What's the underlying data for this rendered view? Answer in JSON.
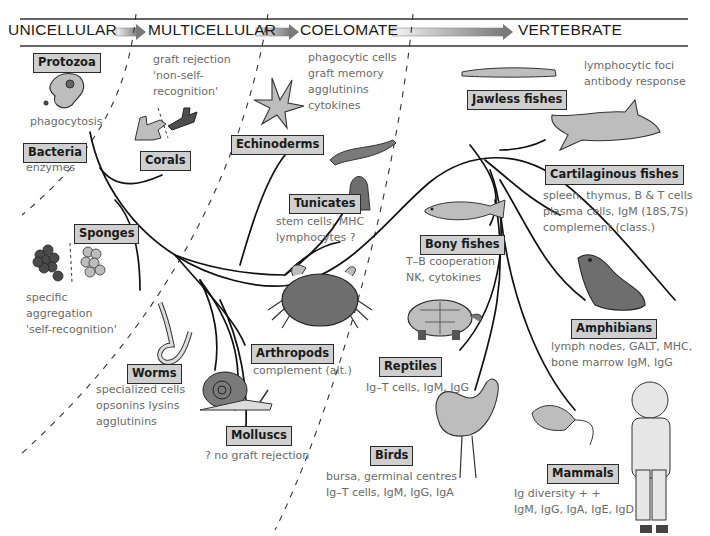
{
  "header": {
    "stages": [
      {
        "label": "UNICELLULAR",
        "x": 8
      },
      {
        "label": "MULTICELLULAR",
        "x": 148
      },
      {
        "label": "COELOMATE",
        "x": 300
      },
      {
        "label": "VERTEBRATE",
        "x": 518
      }
    ],
    "arrow_color_start": "#f2f2f2",
    "arrow_color_end": "#7a7a7a"
  },
  "colors": {
    "tag_fill": "#cfcfcf",
    "tag_border": "#2a2a2a",
    "note_text": "#6a6a6a",
    "animal_fill_light": "#bdbdbd",
    "animal_fill_dark": "#5e5e5e"
  },
  "groups": [
    {
      "id": "protozoa",
      "label": "Protozoa",
      "notes": [
        "phagocytosis"
      ]
    },
    {
      "id": "bacteria",
      "label": "Bacteria",
      "notes": [
        "enzymes"
      ]
    },
    {
      "id": "corals",
      "label": "Corals",
      "notes": []
    },
    {
      "id": "multicellular-notes",
      "label": "",
      "notes": [
        "graft rejection",
        "'non-self-",
        "recognition'"
      ]
    },
    {
      "id": "sponges",
      "label": "Sponges",
      "notes": [
        "specific",
        "aggregation",
        "'self-recognition'"
      ]
    },
    {
      "id": "echinoderms",
      "label": "Echinoderms",
      "notes": []
    },
    {
      "id": "coelomate-notes",
      "label": "",
      "notes": [
        "phagocytic cells",
        "graft memory",
        "agglutinins",
        "cytokines"
      ]
    },
    {
      "id": "tunicates",
      "label": "Tunicates",
      "notes": [
        "stem cells, MHC",
        "lymphocytes ?"
      ]
    },
    {
      "id": "worms",
      "label": "Worms",
      "notes": [
        "specialized cells",
        "opsonins lysins",
        "agglutinins"
      ]
    },
    {
      "id": "arthropods",
      "label": "Arthropods",
      "notes": [
        "complement (alt.)"
      ]
    },
    {
      "id": "molluscs",
      "label": "Molluscs",
      "notes": [
        "? no graft rejection"
      ]
    },
    {
      "id": "jawless-fishes",
      "label": "Jawless fishes",
      "notes": []
    },
    {
      "id": "vertebrate-notes",
      "label": "",
      "notes": [
        "lymphocytic foci",
        "antibody response"
      ]
    },
    {
      "id": "cartilaginous-fishes",
      "label": "Cartilaginous fishes",
      "notes": [
        "spleen, thymus, B & T cells",
        "plasma cells, IgM (18S,7S)",
        "complement (class.)"
      ]
    },
    {
      "id": "bony-fishes",
      "label": "Bony fishes",
      "notes": [
        "T–B cooperation",
        "NK, cytokines"
      ]
    },
    {
      "id": "amphibians",
      "label": "Amphibians",
      "notes": [
        "lymph nodes, GALT, MHC,",
        "bone marrow IgM, IgG"
      ]
    },
    {
      "id": "reptiles",
      "label": "Reptiles",
      "notes": [
        "Ig–T cells, IgM, IgG"
      ]
    },
    {
      "id": "birds",
      "label": "Birds",
      "notes": [
        "bursa, germinal centres",
        "Ig–T cells, IgM, IgG, IgA"
      ]
    },
    {
      "id": "mammals",
      "label": "Mammals",
      "notes": [
        "Ig diversity + +",
        "IgM, IgG, IgA, IgE, IgD"
      ]
    }
  ]
}
